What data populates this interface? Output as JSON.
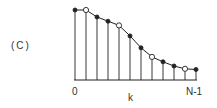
{
  "panel_label": "(C)",
  "x_axis": {
    "label": "k",
    "start_label": "0",
    "end_label": "N-1"
  },
  "sequence": {
    "count": 12,
    "values": [
      1.0,
      1.0,
      0.9,
      0.84,
      0.78,
      0.63,
      0.46,
      0.33,
      0.26,
      0.2,
      0.16,
      0.15
    ],
    "open_indices": [
      1,
      4,
      7,
      10
    ],
    "filled_indices": [
      0,
      2,
      3,
      5,
      6,
      8,
      9,
      11
    ]
  },
  "colors": {
    "line": "#222222",
    "background": "#ffffff"
  }
}
